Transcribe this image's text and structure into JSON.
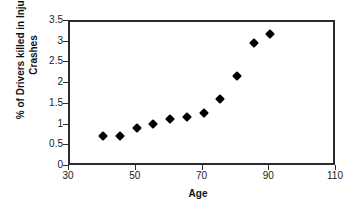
{
  "chart_data": {
    "type": "scatter",
    "title": "",
    "xlabel": "Age",
    "ylabel": "% of Drivers killed in Injury Crashes",
    "ylabel_lines": [
      "% of Drivers killed in Injury",
      "Crashes"
    ],
    "xlim": [
      30,
      110
    ],
    "ylim": [
      0,
      3.5
    ],
    "xticks": [
      30,
      50,
      70,
      90,
      110
    ],
    "xtick_labels": [
      "30",
      "50",
      "70",
      "90",
      "110"
    ],
    "yticks": [
      0,
      0.5,
      1,
      1.5,
      2,
      2.5,
      3,
      3.5
    ],
    "ytick_labels": [
      "0",
      "0.5",
      "1",
      "1.5",
      "2",
      "2.5",
      "3",
      "3.5"
    ],
    "grid": false,
    "legend": false,
    "marker": "diamond",
    "marker_color": "#000000",
    "x": [
      40,
      45,
      50,
      55,
      60,
      65,
      70,
      75,
      80,
      85,
      90
    ],
    "values": [
      0.75,
      0.75,
      0.95,
      1.05,
      1.15,
      1.2,
      1.3,
      1.65,
      2.2,
      3.0,
      3.2
    ],
    "series": [
      {
        "name": "% of Drivers killed in Injury Crashes",
        "x": [
          40,
          45,
          50,
          55,
          60,
          65,
          70,
          75,
          80,
          85,
          90
        ],
        "values": [
          0.75,
          0.75,
          0.95,
          1.05,
          1.15,
          1.2,
          1.3,
          1.65,
          2.2,
          3.0,
          3.2
        ]
      }
    ]
  },
  "style": {
    "frame_color": "#2b2b2b",
    "background": "#ffffff",
    "text_color": "#111111"
  }
}
